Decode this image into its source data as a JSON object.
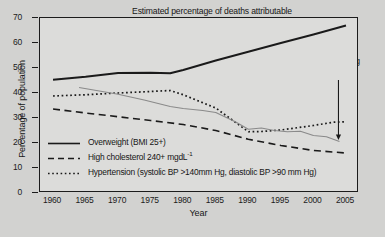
{
  "figure": {
    "title_lines": [
      "Estimated percentage of deaths attributable",
      "to smoking in the UK by cause",
      "(2002 mortality data)"
    ],
    "annotation_lines": [
      "Percentage smoking",
      "given as reference"
    ],
    "xlabel": "Year",
    "ylabel": "Percentage of population"
  },
  "chart_data": {
    "type": "line",
    "title": "Estimated percentage of deaths attributable to smoking in the UK by cause (2002 mortality data)",
    "xlabel": "Year",
    "ylabel": "Percentage of population",
    "xlim": [
      1958,
      2007
    ],
    "ylim": [
      0,
      70
    ],
    "xticks": [
      1960,
      1965,
      1970,
      1975,
      1980,
      1985,
      1990,
      1995,
      2000,
      2005
    ],
    "yticks": [
      0,
      10,
      20,
      30,
      40,
      50,
      60,
      70
    ],
    "grid": false,
    "legend_position": "inside-lower-left",
    "annotations": [
      {
        "text": "Percentage smoking given as reference",
        "points_to_series": "Percentage smoking",
        "arrow_x": 2004,
        "arrow_y": 21
      }
    ],
    "series": [
      {
        "name": "Overweight (BMI 25+)",
        "style": "solid",
        "color": "#1a1a1a",
        "in_legend": true,
        "x": [
          1960,
          1965,
          1970,
          1975,
          1978,
          1980,
          1985,
          1990,
          1995,
          2000,
          2005
        ],
        "values": [
          45.3,
          46.5,
          48.0,
          48.1,
          47.9,
          49.2,
          53.0,
          56.5,
          60.0,
          63.4,
          67.0
        ]
      },
      {
        "name": "High cholesterol 240+ mgdL-1",
        "style": "dashed",
        "color": "#1a1a1a",
        "in_legend": true,
        "x": [
          1960,
          1965,
          1970,
          1975,
          1980,
          1985,
          1990,
          1995,
          2000,
          2005
        ],
        "values": [
          33.6,
          32.0,
          30.5,
          29.0,
          27.4,
          25.0,
          21.5,
          19.0,
          17.0,
          16.0
        ]
      },
      {
        "name": "Hypertension (systolic BP >140mm Hg, diastolic BP >90 mm Hg)",
        "style": "dotted",
        "color": "#1a1a1a",
        "in_legend": true,
        "x": [
          1960,
          1965,
          1970,
          1975,
          1978,
          1980,
          1985,
          1990,
          1992,
          1995,
          2000,
          2003,
          2005
        ],
        "values": [
          38.8,
          39.3,
          40.0,
          40.6,
          41.0,
          39.3,
          34.0,
          24.5,
          24.6,
          25.2,
          27.0,
          28.3,
          28.5
        ]
      },
      {
        "name": "Percentage smoking",
        "style": "solid-grey",
        "color": "#8a8a8a",
        "in_legend": false,
        "x": [
          1964,
          1970,
          1974,
          1978,
          1980,
          1983,
          1985,
          1988,
          1990,
          1992,
          1994,
          1996,
          1998,
          2000,
          2002,
          2004
        ],
        "values": [
          42.2,
          39.5,
          37.2,
          34.6,
          33.8,
          33.0,
          32.2,
          28.5,
          25.5,
          26.0,
          25.0,
          24.5,
          24.7,
          23.0,
          22.5,
          20.6
        ]
      }
    ]
  },
  "legend": {
    "items": [
      {
        "key": "solid",
        "label": "Overweight (BMI 25+)"
      },
      {
        "key": "dashed",
        "label_pre": "High cholesterol 240+ mgdL",
        "label_sup": "-1"
      },
      {
        "key": "dotted",
        "label": "Hypertension (systolic BP >140mm Hg, diastolic BP >90 mm Hg)"
      }
    ]
  },
  "colors": {
    "ink": "#1a1a1a",
    "smoking_line": "#8a8a8a",
    "paper": "#d2d2d0",
    "page": "#cdcdcb"
  }
}
